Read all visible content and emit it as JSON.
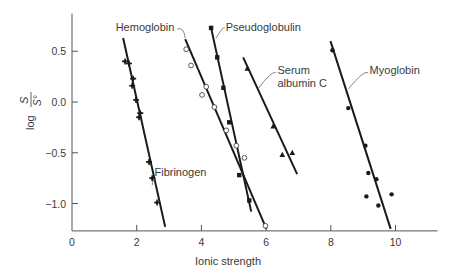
{
  "chart_data": {
    "type": "scatter",
    "title": "",
    "xlabel": "Ionic strength",
    "ylabel": "log S/S°",
    "ylabel_parts": {
      "prefix": "log",
      "numerator": "S",
      "denominator": "S°"
    },
    "xlim": [
      0,
      11.3
    ],
    "ylim": [
      -1.27,
      0.87
    ],
    "x_ticks": [
      0,
      2,
      4,
      6,
      8,
      10
    ],
    "x_tick_labels": [
      "0",
      "2",
      "4",
      "6",
      "8",
      "10"
    ],
    "y_ticks": [
      0.5,
      0.0,
      -0.5,
      -1.0
    ],
    "y_tick_labels": [
      "0.5",
      "0.0",
      "−0.5",
      "−1.0"
    ],
    "grid": false,
    "legend": "inline labels with leader lines",
    "series": [
      {
        "name": "Fibrinogen",
        "marker": "filled-star",
        "fit_line": [
          [
            1.58,
            0.63
          ],
          [
            2.88,
            -1.23
          ]
        ],
        "points": [
          [
            1.64,
            0.4
          ],
          [
            1.76,
            0.38
          ],
          [
            1.89,
            0.23
          ],
          [
            1.86,
            0.16
          ],
          [
            1.98,
            0.02
          ],
          [
            2.11,
            -0.11
          ],
          [
            2.07,
            -0.15
          ],
          [
            2.38,
            -0.59
          ],
          [
            2.48,
            -0.75
          ],
          [
            2.63,
            -0.99
          ]
        ],
        "label_pos": [
          2.55,
          -0.73
        ],
        "label_anchor": "start",
        "leader": [
          [
            2.48,
            -0.82
          ],
          [
            2.6,
            -0.77
          ]
        ]
      },
      {
        "name": "Hemoglobin",
        "marker": "open-circle",
        "fit_line": [
          [
            3.5,
            0.62
          ],
          [
            6.01,
            -1.25
          ]
        ],
        "points": [
          [
            3.53,
            0.52
          ],
          [
            3.68,
            0.36
          ],
          [
            4.15,
            0.15
          ],
          [
            4.02,
            0.07
          ],
          [
            4.4,
            -0.05
          ],
          [
            4.77,
            -0.28
          ],
          [
            5.08,
            -0.43
          ],
          [
            5.33,
            -0.55
          ],
          [
            5.98,
            -1.22
          ]
        ],
        "label_pos": [
          1.35,
          0.7
        ],
        "label_anchor": "start",
        "leader": [
          [
            3.25,
            0.72
          ],
          [
            3.5,
            0.63
          ]
        ]
      },
      {
        "name": "Pseudoglobulin",
        "marker": "filled-square",
        "fit_line": [
          [
            4.3,
            0.73
          ],
          [
            5.54,
            -1.08
          ]
        ],
        "points": [
          [
            4.3,
            0.73
          ],
          [
            4.49,
            0.44
          ],
          [
            4.68,
            0.14
          ],
          [
            4.86,
            -0.2
          ],
          [
            5.17,
            -0.72
          ],
          [
            5.48,
            -0.97
          ]
        ],
        "label_pos": [
          4.75,
          0.7
        ],
        "label_anchor": "start",
        "leader": [
          [
            4.72,
            0.73
          ],
          [
            4.45,
            0.63
          ]
        ]
      },
      {
        "name": "Serum albumin C",
        "label_lines": [
          "Serum",
          "albumin C"
        ],
        "marker": "filled-triangle",
        "fit_line": [
          [
            5.29,
            0.44
          ],
          [
            6.96,
            -0.71
          ]
        ],
        "points": [
          [
            5.42,
            0.33
          ],
          [
            6.22,
            -0.24
          ],
          [
            6.5,
            -0.52
          ],
          [
            6.81,
            -0.5
          ]
        ],
        "label_pos": [
          6.35,
          0.28
        ],
        "label_anchor": "start",
        "leader": [
          [
            6.3,
            0.29
          ],
          [
            5.75,
            0.13
          ]
        ]
      },
      {
        "name": "Myoglobin",
        "marker": "filled-circle",
        "fit_line": [
          [
            7.99,
            0.6
          ],
          [
            9.85,
            -1.25
          ]
        ],
        "points": [
          [
            8.05,
            0.51
          ],
          [
            8.54,
            -0.06
          ],
          [
            9.07,
            -0.43
          ],
          [
            9.16,
            -0.7
          ],
          [
            9.41,
            -0.76
          ],
          [
            9.1,
            -0.93
          ],
          [
            9.47,
            -1.02
          ],
          [
            9.88,
            -0.91
          ]
        ],
        "label_pos": [
          9.2,
          0.28
        ],
        "label_anchor": "start",
        "leader": [
          [
            9.15,
            0.29
          ],
          [
            8.55,
            0.13
          ]
        ]
      }
    ],
    "colors": {
      "line": "#1a1a1a",
      "marker": "#1a1a1a",
      "axis": "#555555",
      "text": "#3a3a3a",
      "background": "#ffffff"
    }
  }
}
